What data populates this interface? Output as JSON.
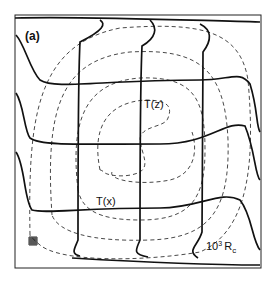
{
  "figure": {
    "panel_label": "(a)",
    "curve_labels": {
      "vertical_profile": "T(z)",
      "horizontal_profile": "T(x)"
    },
    "parameter_label": {
      "prefix": "10",
      "exponent": "3",
      "symbol": "R",
      "subscript": "c"
    },
    "legend_icons": [
      "grid-mesh-icon"
    ],
    "colors": {
      "line": "#111111",
      "background": "#ffffff"
    },
    "elements": {
      "frame": "square convection cell boundary",
      "streamlines": "dashed nested closed contours",
      "temperature_profiles_horizontal": 4,
      "temperature_profiles_vertical": 3
    }
  }
}
